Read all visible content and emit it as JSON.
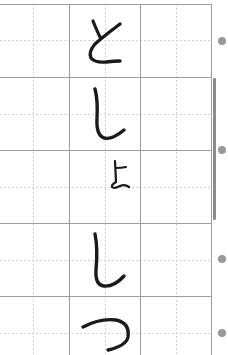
{
  "worksheet": {
    "type": "hiragana-stroke-practice-grid",
    "rows": [
      {
        "index": 0,
        "characters": "と",
        "label": "と",
        "size": "large"
      },
      {
        "index": 1,
        "characters": "しょ",
        "label": "しょ",
        "size": "large+small"
      },
      {
        "index": 2,
        "characters": "し",
        "label": "し",
        "size": "large"
      },
      {
        "index": 3,
        "characters": "つ",
        "label": "つ",
        "size": "large"
      }
    ],
    "word": "としょしつ",
    "row_markers": 4,
    "colors": {
      "ink": "#1a1a1a",
      "grid_solid": "#9a9a9a",
      "grid_dashed": "#cfcfcf",
      "marker": "#999999",
      "scrollbar": "#8c8c8c"
    }
  }
}
